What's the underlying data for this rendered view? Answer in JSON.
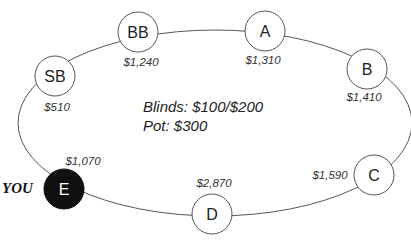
{
  "table": {
    "info": {
      "blinds": "Blinds: $100/$200",
      "pot": "Pot: $300"
    },
    "hero_label": "YOU",
    "seats": [
      {
        "id": "BB",
        "label": "BB",
        "stack": "$1,240",
        "hero": false
      },
      {
        "id": "A",
        "label": "A",
        "stack": "$1,310",
        "hero": false
      },
      {
        "id": "SB",
        "label": "SB",
        "stack": "$510",
        "hero": false
      },
      {
        "id": "B",
        "label": "B",
        "stack": "$1,410",
        "hero": false
      },
      {
        "id": "C",
        "label": "C",
        "stack": "$1,590",
        "hero": false
      },
      {
        "id": "D",
        "label": "D",
        "stack": "$2,870",
        "hero": false
      },
      {
        "id": "E",
        "label": "E",
        "stack": "$1,070",
        "hero": true
      }
    ],
    "colors": {
      "table_line": "#555555",
      "seat_fill": "#ffffff",
      "hero_fill": "#111111"
    }
  }
}
